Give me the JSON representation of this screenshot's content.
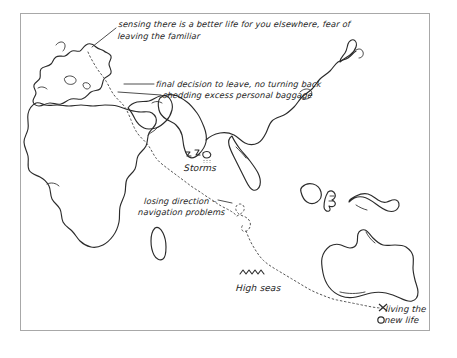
{
  "page": {
    "background_color": "#ffffff",
    "border_color": "#a8a8a8",
    "ink_color": "#2b2b2b",
    "route_color": "#555555"
  },
  "annotations": {
    "sensing_line1": "sensing there is a better life for you elsewhere, fear of",
    "sensing_line2": "leaving the familiar",
    "final_decision": "final decision to leave, no turning back",
    "shedding": "shedding excess personal baggage",
    "storms": "Storms",
    "losing_direction": "losing direction –",
    "navigation_problems": "navigation problems",
    "high_seas": "High seas",
    "living_new_life_line1": "living the",
    "living_new_life_line2": "new life"
  },
  "map": {
    "landmasses": [
      "europe-mediterranean",
      "africa",
      "madagascar",
      "arabia",
      "india",
      "east-asia",
      "japan",
      "indonesia",
      "borneo",
      "new-guinea",
      "australia"
    ],
    "route_name": "journey-route-dotted",
    "route_start": "north-west-europe",
    "route_end": "south-east-australia"
  },
  "symbols": {
    "storm_icon": "lightning-storm-icon",
    "waves_icon": "high-seas-waves-icon",
    "destination_marker": "destination-x-marker",
    "origin_marker": "origin-circle-marker"
  }
}
